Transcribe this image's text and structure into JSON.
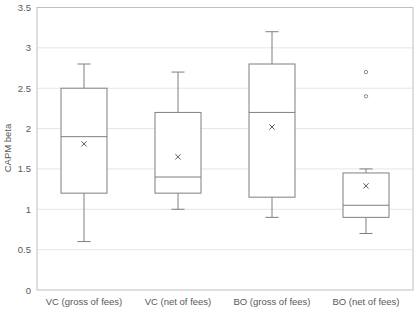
{
  "chart_data": {
    "type": "box",
    "title": "",
    "xlabel": "",
    "ylabel": "CAPM beta",
    "ylim": [
      0,
      3.5
    ],
    "yticks": [
      0,
      0.5,
      1,
      1.5,
      2,
      2.5,
      3,
      3.5
    ],
    "ytick_labels": [
      "0",
      "0.5",
      "1",
      "1.5",
      "2",
      "2.5",
      "3",
      "3.5"
    ],
    "grid": true,
    "legend": null,
    "categories": [
      "VC (gross of fees)",
      "VC (net of fees)",
      "BO (gross of fees)",
      "BO (net of fees)"
    ],
    "series": [
      {
        "name": "VC (gross of fees)",
        "whisker_low": 0.6,
        "q1": 1.2,
        "median": 1.9,
        "q3": 2.5,
        "whisker_high": 2.8,
        "mean": 1.81,
        "outliers": []
      },
      {
        "name": "VC (net of fees)",
        "whisker_low": 1.0,
        "q1": 1.2,
        "median": 1.4,
        "q3": 2.2,
        "whisker_high": 2.7,
        "mean": 1.65,
        "outliers": []
      },
      {
        "name": "BO (gross of fees)",
        "whisker_low": 0.9,
        "q1": 1.15,
        "median": 2.2,
        "q3": 2.8,
        "whisker_high": 3.2,
        "mean": 2.02,
        "outliers": []
      },
      {
        "name": "BO (net of fees)",
        "whisker_low": 0.7,
        "q1": 0.9,
        "median": 1.05,
        "q3": 1.45,
        "whisker_high": 1.5,
        "mean": 1.29,
        "outliers": [
          2.4,
          2.7
        ]
      }
    ],
    "colors": {
      "box": "#7f7f7f",
      "grid": "#e6e6e6",
      "axis": "#bfbfbf",
      "text": "#595959"
    }
  }
}
